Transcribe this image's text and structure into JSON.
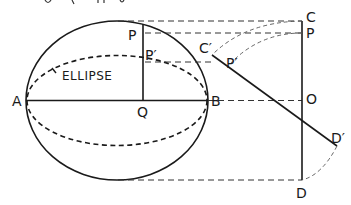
{
  "header_fragment": "ig  ·  ·  ·  ·  ·  ·  ·  ·  ·  g",
  "labels": {
    "P_left": "P",
    "Pprime_left": "P′",
    "A": "A",
    "B": "B",
    "Q": "Q",
    "ellipse": "ELLIPSE",
    "C": "C",
    "P_right": "P",
    "Cprime": "C′",
    "Pprime_right": "P′",
    "O": "O",
    "Dprime": "D′",
    "D": "D"
  },
  "colors": {
    "ink": "#1a1a1a",
    "background": "#ffffff"
  }
}
